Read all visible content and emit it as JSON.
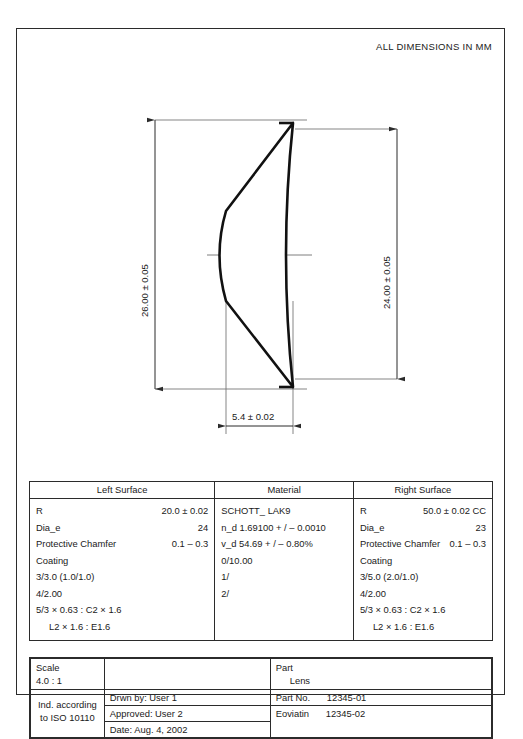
{
  "header": {
    "note": "ALL DIMENSIONS IN MM"
  },
  "drawing": {
    "dim_left_vertical": "26.00 ± 0.05",
    "dim_right_vertical": "24.00 ± 0.05",
    "dim_thickness": "5.4 ± 0.02"
  },
  "spec_table": {
    "headers": {
      "left_surface": "Left Surface",
      "material": "Material",
      "right_surface": "Right Surface"
    },
    "left_surface": [
      {
        "key": "R",
        "value": "20.0 ± 0.02"
      },
      {
        "key": "Dia_e",
        "value": "24"
      },
      {
        "key": "Protective Chamfer",
        "value": "0.1 – 0.3"
      },
      {
        "key": "Coating",
        "value": ""
      },
      {
        "key": "3/3.0 (1.0/1.0)",
        "value": ""
      },
      {
        "key": "4/2.00",
        "value": ""
      },
      {
        "key": "5/3 × 0.63 : C2 × 1.6",
        "value": ""
      },
      {
        "key": "L2 × 1.6  : E1.6",
        "value": ""
      }
    ],
    "material": [
      {
        "key": "SCHOTT_  LAK9",
        "value": ""
      },
      {
        "key": "n_d 1.69100 + / – 0.0010",
        "value": ""
      },
      {
        "key": "v_d 54.69 + / – 0.80%",
        "value": ""
      },
      {
        "key": "0/10.00",
        "value": ""
      },
      {
        "key": "1/",
        "value": ""
      },
      {
        "key": "2/",
        "value": ""
      }
    ],
    "right_surface": [
      {
        "key": "R",
        "value": "50.0 ± 0.02 CC"
      },
      {
        "key": "Dia_e",
        "value": "23"
      },
      {
        "key": "Protective Chamfer",
        "value": "0.1 – 0.3"
      },
      {
        "key": "Coating",
        "value": ""
      },
      {
        "key": "3/5.0 (2.0/1.0)",
        "value": ""
      },
      {
        "key": "4/2.00",
        "value": ""
      },
      {
        "key": "5/3 × 0.63 : C2 × 1.6",
        "value": ""
      },
      {
        "key": "L2 × 1.6  : E1.6",
        "value": ""
      }
    ]
  },
  "title_block": {
    "scale_label": "Scale",
    "scale_value": "4.0 :  1",
    "standard_line1": "Ind. according",
    "standard_line2": "to ISO 10110",
    "drawn_by": "Drwn by: User 1",
    "approved": "Approved: User 2",
    "date": "Date: Aug. 4, 2002",
    "part_label": "Part",
    "part_value": "Lens",
    "part_no_label": "Part No.",
    "part_no_value": "12345-01",
    "eval_label": "Eoviatin",
    "eval_value": "12345-02"
  },
  "colors": {
    "line": "#2b2b2b",
    "thin_line": "#6b6b6b",
    "lens_outline": "#111111",
    "background": "#ffffff"
  }
}
